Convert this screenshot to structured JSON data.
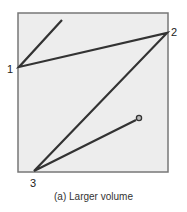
{
  "diagram": {
    "box": {
      "x": 18,
      "y": 13,
      "w": 150,
      "h": 159,
      "fill": "#ededed",
      "stroke": "#777777"
    },
    "path_color": "#333333",
    "start": {
      "x": 62,
      "y": 20
    },
    "points": [
      {
        "label": "1",
        "x": 19,
        "y": 67
      },
      {
        "label": "2",
        "x": 167,
        "y": 33
      },
      {
        "label": "3",
        "x": 34,
        "y": 171
      }
    ],
    "end": {
      "x": 139,
      "y": 118
    }
  },
  "labels": {
    "p1": "1",
    "p2": "2",
    "p3": "3"
  },
  "caption": "(a) Larger volume"
}
